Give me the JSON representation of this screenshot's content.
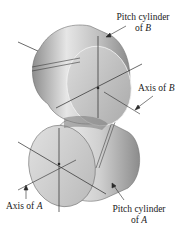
{
  "figure": {
    "labels": {
      "pitch_cylinder_b": {
        "line1": "Pitch cylinder",
        "line2_prefix": "of ",
        "line2_var": "B"
      },
      "axis_b": {
        "prefix": "Axis of ",
        "var": "B"
      },
      "axis_a": {
        "prefix": "Axis of ",
        "var": "A"
      },
      "pitch_cylinder_a": {
        "line1": "Pitch cylinder",
        "line2_prefix": "of ",
        "line2_var": "A"
      }
    },
    "colors": {
      "cylinder_light": "#e8e8e8",
      "cylinder_mid": "#c4c4c4",
      "cylinder_dark": "#8f8f8f",
      "face": "#cfcfcf",
      "line": "#2a2a2a",
      "background": "#ffffff"
    }
  }
}
